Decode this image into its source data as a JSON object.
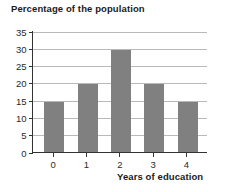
{
  "chart_data": {
    "type": "bar",
    "title": "Percentage of the population",
    "xlabel": "Years of education",
    "ylabel": "",
    "categories": [
      "0",
      "1",
      "2",
      "3",
      "4"
    ],
    "values": [
      15,
      20,
      30,
      20,
      15
    ],
    "ylim": [
      0,
      35
    ],
    "yticks": [
      0,
      5,
      10,
      15,
      20,
      25,
      30,
      35
    ],
    "ytick_labels": [
      "0",
      "5",
      "10",
      "15",
      "20",
      "25",
      "30",
      "35"
    ],
    "grid": "horizontal",
    "legend": "none",
    "bar_color": "#808080",
    "gridline_color": "#b9b9b9",
    "axis_color": "#333333",
    "background_color": "#ffffff",
    "text_color": "#1b1b1b"
  }
}
